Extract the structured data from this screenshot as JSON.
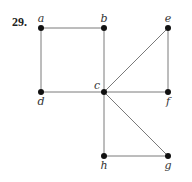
{
  "problem_number": "29.",
  "graph": {
    "vertices": [
      {
        "id": "a",
        "x": 41,
        "y": 28,
        "label_dx": 0,
        "label_dy": -6
      },
      {
        "id": "b",
        "x": 104,
        "y": 28,
        "label_dx": 0,
        "label_dy": -6
      },
      {
        "id": "e",
        "x": 168,
        "y": 28,
        "label_dx": 0,
        "label_dy": -6
      },
      {
        "id": "d",
        "x": 41,
        "y": 92,
        "label_dx": 0,
        "label_dy": 13
      },
      {
        "id": "c",
        "x": 104,
        "y": 92,
        "label_dx": -7,
        "label_dy": -3
      },
      {
        "id": "f",
        "x": 168,
        "y": 92,
        "label_dx": 0,
        "label_dy": 13
      },
      {
        "id": "h",
        "x": 104,
        "y": 156,
        "label_dx": 0,
        "label_dy": 13
      },
      {
        "id": "g",
        "x": 168,
        "y": 156,
        "label_dx": 0,
        "label_dy": 13
      }
    ],
    "edges": [
      [
        "a",
        "b"
      ],
      [
        "a",
        "d"
      ],
      [
        "b",
        "c"
      ],
      [
        "d",
        "c"
      ],
      [
        "c",
        "e"
      ],
      [
        "e",
        "f"
      ],
      [
        "c",
        "f"
      ],
      [
        "c",
        "h"
      ],
      [
        "c",
        "g"
      ],
      [
        "h",
        "g"
      ]
    ]
  },
  "colors": {
    "edge": "#7a7a7a",
    "node": "#111111"
  }
}
